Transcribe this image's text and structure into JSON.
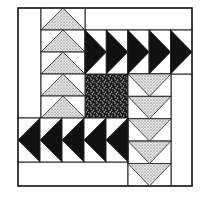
{
  "diagram": {
    "colors": {
      "background": "#ffffff",
      "line": "#222222",
      "black": "#111111",
      "dotted_light": "#d9d9d9",
      "dotted_dark": "#555555"
    },
    "block": {
      "x": 18,
      "y": 8,
      "w": 174,
      "h": 178
    },
    "regions": [
      {
        "name": "left-strip",
        "x": 18,
        "y": 8,
        "w": 23,
        "h": 110,
        "fill": "white"
      },
      {
        "name": "top-strip",
        "x": 85,
        "y": 8,
        "w": 107,
        "h": 22,
        "fill": "white"
      },
      {
        "name": "center-square",
        "x": 85,
        "y": 74,
        "w": 43,
        "h": 44,
        "fill": "speckled"
      },
      {
        "name": "right-strip",
        "x": 171,
        "y": 74,
        "w": 21,
        "h": 112,
        "fill": "white"
      },
      {
        "name": "bottom-strip",
        "x": 18,
        "y": 162,
        "w": 110,
        "h": 24,
        "fill": "white"
      }
    ],
    "geese_groups": [
      {
        "name": "up-geese",
        "direction": "up",
        "fill": "dotted",
        "x": 41,
        "y": 8,
        "w": 44,
        "h": 110,
        "count": 5
      },
      {
        "name": "right-geese",
        "direction": "right",
        "fill": "black",
        "x": 85,
        "y": 30,
        "w": 107,
        "h": 44,
        "count": 5
      },
      {
        "name": "down-geese",
        "direction": "down",
        "fill": "dotted",
        "x": 128,
        "y": 74,
        "w": 43,
        "h": 112,
        "count": 5
      },
      {
        "name": "left-geese",
        "direction": "left",
        "fill": "black",
        "x": 18,
        "y": 118,
        "w": 110,
        "h": 44,
        "count": 5
      }
    ]
  }
}
